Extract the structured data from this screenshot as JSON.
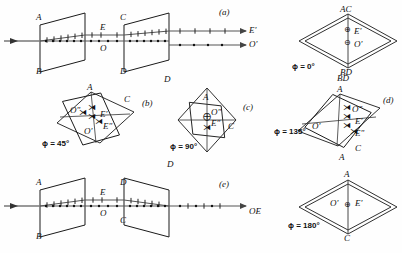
{
  "figure": {
    "stroke_color": "#1a1a1a",
    "ray_color": "#555555",
    "background": "#fefefe",
    "degree_symbol": "°",
    "symbols": {
      "e_ray_dot": "⊕",
      "o_ray_minus": "⊖",
      "arrow_head": "▶"
    }
  },
  "rows": {
    "a": {
      "panel_id": "(a)",
      "plate1": {
        "top_label": "A",
        "bottom_label": "B"
      },
      "plate2": {
        "top_label": "C",
        "bottom_label": "D"
      },
      "mid_labels": {
        "e_ray": "E",
        "o_ray": "O"
      },
      "out_labels": {
        "e_ray": "E'",
        "o_ray": "O'"
      },
      "diagram": {
        "phi": "ϕ = 0°",
        "top_vertex": "AC",
        "bottom_vertex": "BD",
        "inner": [
          {
            "symbol": "⊕",
            "label": "E'"
          },
          {
            "symbol": "⊖",
            "label": "O'"
          }
        ]
      }
    },
    "b": {
      "panel_id": "(b)",
      "phi": "ϕ = 45°",
      "vertices": {
        "top": "A",
        "right": "C",
        "left": "B"
      },
      "inner": [
        {
          "label": "O\""
        },
        {
          "label": "E'"
        },
        {
          "label": "E\""
        },
        {
          "label": "O'"
        }
      ]
    },
    "c": {
      "panel_id": "(c)",
      "phi": "ϕ = 90°",
      "vertices": {
        "top": "A",
        "right": "C",
        "left": "D",
        "bottom": "D"
      },
      "inner": [
        {
          "label": "O\""
        },
        {
          "label": "E\""
        }
      ]
    },
    "d": {
      "panel_id": "(d)",
      "phi": "ϕ = 135°",
      "vertices": {
        "top": "A",
        "bottom_right": "C",
        "left": "O'",
        "above": "BD",
        "below": "A"
      },
      "inner": [
        {
          "label": "O\""
        },
        {
          "label": "E'"
        },
        {
          "label": "E\""
        },
        {
          "label": "O'"
        }
      ]
    },
    "e": {
      "panel_id": "(e)",
      "plate1": {
        "top_label": "A",
        "bottom_label": "B"
      },
      "plate2": {
        "top_label": "D",
        "bottom_label": "C"
      },
      "mid_labels": {
        "e_ray": "E",
        "o_ray": "O"
      },
      "out_labels": {
        "combined": "OE"
      },
      "diagram": {
        "phi": "ϕ = 180°",
        "top_vertex": "A",
        "bottom_vertex": "C",
        "inner": [
          {
            "left_label": "O'",
            "symbol": "⊕",
            "right_label": "E'"
          }
        ]
      }
    }
  }
}
